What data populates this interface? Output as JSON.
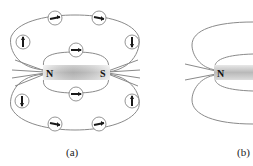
{
  "figure_a": {
    "caption": "(a)",
    "magnet": {
      "north_label": "N",
      "south_label": "S"
    },
    "compass_count": 10
  },
  "figure_b": {
    "caption": "(b)",
    "magnet": {
      "north_label": "N"
    }
  },
  "colors": {
    "field_line": "#8a8a8a",
    "needle": "#1a1a1a",
    "compass_ring": "#7a7a7a"
  }
}
